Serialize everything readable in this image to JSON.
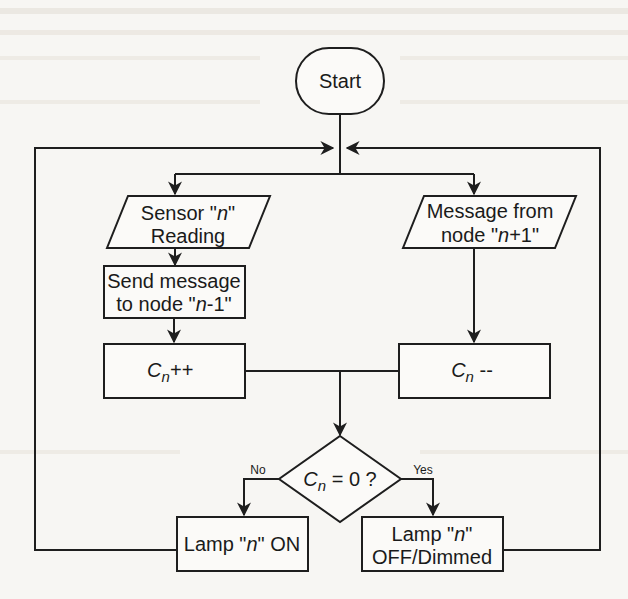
{
  "diagram": {
    "type": "flowchart",
    "nodes": {
      "start": {
        "label": "Start",
        "shape": "terminator"
      },
      "sensor": {
        "line1": "Sensor \"",
        "var": "n",
        "line1_end": "\"",
        "line2": "Reading",
        "shape": "input-output"
      },
      "message_in": {
        "line1": "Message from",
        "line2_pre": "node \"",
        "var": "n",
        "line2_post": "+1\"",
        "shape": "input-output"
      },
      "send": {
        "line1": "Send message",
        "line2_pre": "to node \"",
        "var": "n",
        "line2_post": "-1\"",
        "shape": "process"
      },
      "inc": {
        "var": "C",
        "sub": "n",
        "op": "++",
        "shape": "process"
      },
      "dec": {
        "var": "C",
        "sub": "n",
        "op": " --",
        "shape": "process"
      },
      "decision": {
        "var": "C",
        "sub": "n",
        "rest": " = 0 ?",
        "shape": "decision"
      },
      "lamp_on": {
        "pre": "Lamp \"",
        "var": "n",
        "post": "\" ON",
        "shape": "process"
      },
      "lamp_off": {
        "line1_pre": "Lamp \"",
        "var": "n",
        "line1_post": "\"",
        "line2": "OFF/Dimmed",
        "shape": "process"
      }
    },
    "branch_labels": {
      "no": "No",
      "yes": "Yes"
    },
    "edges": [
      [
        "start",
        "sensor"
      ],
      [
        "start",
        "message_in"
      ],
      [
        "sensor",
        "send"
      ],
      [
        "send",
        "inc"
      ],
      [
        "message_in",
        "dec"
      ],
      [
        "inc",
        "decision"
      ],
      [
        "dec",
        "decision"
      ],
      [
        "decision",
        "lamp_on",
        "No"
      ],
      [
        "decision",
        "lamp_off",
        "Yes"
      ],
      [
        "lamp_on",
        "loop-back"
      ],
      [
        "lamp_off",
        "loop-back"
      ]
    ]
  },
  "colors": {
    "ink": "#1e1e1e",
    "paper": "#f7f6f3"
  }
}
